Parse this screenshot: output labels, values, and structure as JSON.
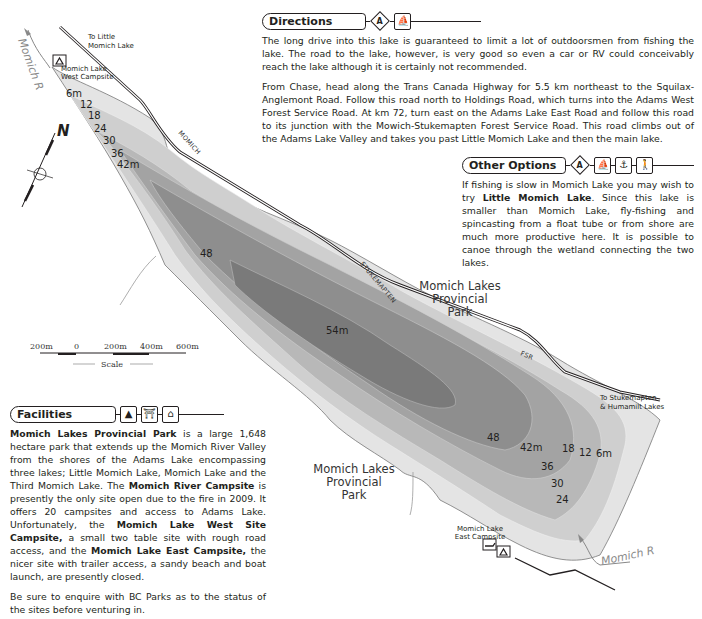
{
  "map": {
    "lake_name": "Momich Lake",
    "depth_labels_north": [
      "6m",
      "12",
      "18",
      "24",
      "30",
      "36",
      "42m"
    ],
    "depth_labels_center": [
      "48",
      "54m"
    ],
    "depth_labels_south": [
      "48",
      "42m",
      "36",
      "30",
      "24",
      "18",
      "12",
      "6m"
    ],
    "places": {
      "to_little_momich": [
        "To Little",
        "Momich Lake"
      ],
      "west_campsite": [
        "Momich Lake",
        "West Campsite"
      ],
      "east_campsite": [
        "Momich Lake",
        "East Campsite"
      ],
      "park_north": [
        "Momich Lakes",
        "Provincial",
        "Park"
      ],
      "park_south": [
        "Momich Lakes",
        "Provincial",
        "Park"
      ],
      "to_stukemapten": [
        "To Stukemapten",
        "& Humamilt Lakes"
      ]
    },
    "roads": {
      "label_1": "MOMICH",
      "label_2": "STUKEMAPTEN",
      "label_3": "FSR"
    },
    "rivers": {
      "north": "Momich R",
      "south": "Momich R"
    },
    "compass": {
      "label": "N"
    },
    "scale": {
      "ticks": [
        "200m",
        "0",
        "200m",
        "400m",
        "600m"
      ],
      "title": "Scale"
    },
    "colors": {
      "deep": "#6f6f6f",
      "shallow": "#e6e6e6",
      "road": "#231f20"
    }
  },
  "directions": {
    "title": "Directions",
    "icons": [
      "access-a",
      "boat-launch"
    ],
    "paragraphs": [
      "The long drive into this lake is guaranteed to limit a lot of outdoorsmen from fishing the lake. The road to the lake, however, is very good so even a car or RV could conceivably reach the lake although it is certainly not recommended.",
      "From Chase, head along the Trans Canada Highway for 5.5 km northeast to the Squilax-Anglemont Road. Follow this road north to Holdings Road, which turns into the Adams West Forest Service Road. At km 72, turn east on the Adams Lake East Road and follow this road to its junction with the Mowich-Stukemapten Forest Service Road. This road climbs out of the Adams Lake Valley and takes you past Little Momich Lake and then the main lake."
    ]
  },
  "other_options": {
    "title": "Other Options",
    "icons": [
      "access-a",
      "canoe",
      "anchor",
      "hiking"
    ],
    "text_before": "If fishing is slow in Momich Lake you may wish to try ",
    "bold": "Little Momich Lake",
    "text_after": ". Since this lake is smaller than Momich Lake, fly-fishing and spincasting from a float tube or from shore are much more productive here. It is possible to canoe through the wetland connecting the two lakes."
  },
  "facilities": {
    "title": "Facilities",
    "icons": [
      "campsite",
      "picnic-table",
      "outhouse"
    ],
    "p1": {
      "b1": "Momich Lakes Provincial Park",
      "t1": " is a large 1,648 hectare park that extends up the Momich River Valley from the shores of the Adams Lake encompassing three lakes; Little Momich Lake, Momich Lake and the Third Momich Lake. The ",
      "b2": "Momich River Campsite",
      "t2": " is presently the only site open due to the fire in 2009. It offers 20 campsites and access to Adams Lake. Unfortunately, the ",
      "b3": "Momich Lake West Site Campsite,",
      "t3": " a small two table site with rough road access, and the ",
      "b4": "Momich Lake East Campsite,",
      "t4": " the nicer site with trailer access, a sandy beach and boat launch, are presently closed."
    },
    "p2": "Be sure to enquire with BC Parks as to the status of the sites before venturing in."
  }
}
